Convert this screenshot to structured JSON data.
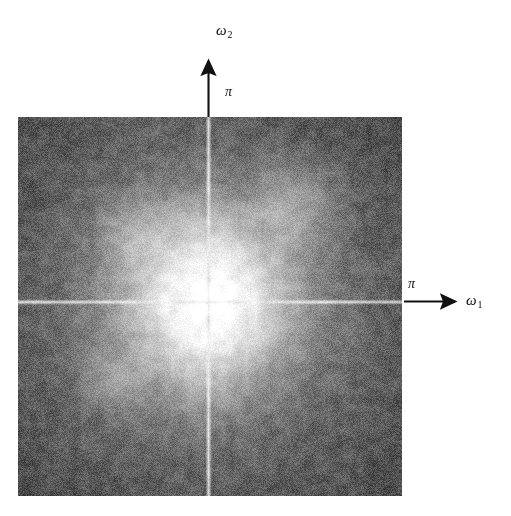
{
  "figure": {
    "caption": ""
  },
  "axes": {
    "vertical": {
      "name": "omega-2",
      "label": "ω",
      "subscript": "2",
      "tick_label": "π",
      "direction": "up",
      "arrow_color": "#111111"
    },
    "horizontal": {
      "name": "omega-1",
      "label": "ω",
      "subscript": "1",
      "tick_label": "π",
      "direction": "right",
      "arrow_color": "#111111"
    }
  },
  "chart_data": {
    "type": "heatmap",
    "subtitle": "",
    "xlabel": "ω₁",
    "ylabel": "ω₂",
    "colormap": "grayscale",
    "colorbar": false,
    "grid": false,
    "legend_position": "none",
    "xlim": [
      -3.14159,
      3.14159
    ],
    "ylim": [
      -3.14159,
      3.14159
    ],
    "xticks": [
      3.14159
    ],
    "xtick_labels": [
      "π"
    ],
    "yticks": [
      3.14159
    ],
    "ytick_labels": [
      "π"
    ],
    "annotations": [
      {
        "text": "ω₂",
        "x": 0.02,
        "y": 1.28,
        "kind": "axis-label"
      },
      {
        "text": "π",
        "x": 0.1,
        "y": 1.08,
        "kind": "tick-label"
      },
      {
        "text": "ω₁",
        "x": 1.33,
        "y": 0.03,
        "kind": "axis-label"
      },
      {
        "text": "π",
        "x": 1.07,
        "y": 0.09,
        "kind": "tick-label"
      }
    ],
    "field": {
      "description": "Radially decaying low-pass magnitude blob with bright DC cross lines on a noisy halftone background",
      "width_px": 384,
      "height_px": 379,
      "dc_center_x_frac": 0.495,
      "dc_center_y_frac": 0.487,
      "peak_value": 1.0,
      "background_value": 0.44,
      "floor_value": 0.3,
      "blob_sigma_x_frac": 0.165,
      "blob_sigma_y_frac": 0.205,
      "cross_line_brightness": 0.92,
      "cross_line_width_px": 2,
      "noise_amplitude": 0.115,
      "halftone_amplitude": 0.055,
      "radial_profile_r": [
        0.0,
        0.06,
        0.12,
        0.18,
        0.24,
        0.3,
        0.38,
        0.48,
        0.6,
        0.75,
        1.0
      ],
      "radial_profile_value": [
        1.0,
        0.99,
        0.96,
        0.9,
        0.8,
        0.69,
        0.58,
        0.5,
        0.45,
        0.42,
        0.4
      ],
      "hotspots": [
        {
          "x_frac": 0.72,
          "y_frac": 0.23,
          "value": 0.66,
          "radius_frac": 0.07
        },
        {
          "x_frac": 0.3,
          "y_frac": 0.3,
          "value": 0.6,
          "radius_frac": 0.06
        },
        {
          "x_frac": 0.25,
          "y_frac": 0.7,
          "value": 0.58,
          "radius_frac": 0.06
        }
      ]
    }
  }
}
